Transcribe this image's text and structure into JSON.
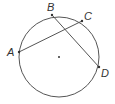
{
  "diagram": {
    "type": "circle-with-intersecting-chords",
    "circle": {
      "cx": 59,
      "cy": 57,
      "r": 40,
      "stroke": "#555555"
    },
    "center_dot": {
      "x": 59,
      "y": 57
    },
    "points": [
      {
        "name": "A",
        "x": 19,
        "y": 52,
        "label_x": 7,
        "label_y": 56
      },
      {
        "name": "B",
        "x": 52,
        "y": 15,
        "label_x": 47,
        "label_y": 11
      },
      {
        "name": "C",
        "x": 82,
        "y": 21,
        "label_x": 84,
        "label_y": 20
      },
      {
        "name": "D",
        "x": 99,
        "y": 67,
        "label_x": 101,
        "label_y": 77
      }
    ],
    "chords": [
      {
        "from": "A",
        "to": "C"
      },
      {
        "from": "B",
        "to": "D"
      }
    ],
    "stroke_color": "#555555",
    "label_color": "#333333"
  },
  "labels": {
    "A": "A",
    "B": "B",
    "C": "C",
    "D": "D"
  }
}
